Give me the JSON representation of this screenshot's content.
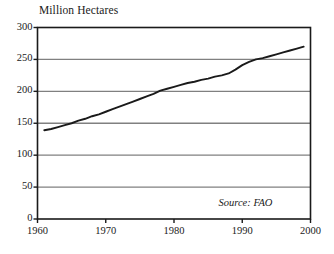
{
  "chart_data": {
    "type": "line",
    "title": "Million Hectares",
    "xlabel": "",
    "ylabel": "",
    "xlim": [
      1960,
      2000
    ],
    "ylim": [
      0,
      300
    ],
    "grid": "horizontal",
    "legend": "none",
    "annotation": "Source: FAO",
    "x_ticks": [
      "1960",
      "1970",
      "1980",
      "1990",
      "2000"
    ],
    "y_ticks": [
      "0",
      "50",
      "100",
      "150",
      "200",
      "250",
      "300"
    ],
    "series": [
      {
        "name": "Irrigated area",
        "x": [
          1961,
          1962,
          1963,
          1964,
          1965,
          1966,
          1967,
          1968,
          1969,
          1970,
          1971,
          1972,
          1973,
          1974,
          1975,
          1976,
          1977,
          1978,
          1979,
          1980,
          1981,
          1982,
          1983,
          1984,
          1985,
          1986,
          1987,
          1988,
          1989,
          1990,
          1991,
          1992,
          1993,
          1994,
          1995,
          1996,
          1997,
          1998,
          1999
        ],
        "values": [
          139,
          141,
          144,
          147,
          150,
          154,
          157,
          161,
          164,
          168,
          172,
          176,
          180,
          184,
          188,
          192,
          196,
          201,
          204,
          207,
          210,
          213,
          215,
          218,
          220,
          223,
          225,
          228,
          234,
          241,
          246,
          250,
          252,
          255,
          258,
          261,
          264,
          267,
          270
        ]
      }
    ]
  },
  "chart": {
    "title": "Million Hectares",
    "source": "Source: FAO",
    "y_axis": {
      "ticks": [
        {
          "label": "300",
          "value": 300
        },
        {
          "label": "250",
          "value": 250
        },
        {
          "label": "200",
          "value": 200
        },
        {
          "label": "150",
          "value": 150
        },
        {
          "label": "100",
          "value": 100
        },
        {
          "label": "50",
          "value": 50
        },
        {
          "label": "0",
          "value": 0
        }
      ]
    },
    "x_axis": {
      "ticks": [
        {
          "label": "1960",
          "value": 1960
        },
        {
          "label": "1970",
          "value": 1970
        },
        {
          "label": "1980",
          "value": 1980
        },
        {
          "label": "1990",
          "value": 1990
        },
        {
          "label": "2000",
          "value": 2000
        }
      ]
    },
    "colors": {
      "background": "#ffffff",
      "frame": "#1a1a1a",
      "gridline": "#808080",
      "data_line": "#1a1a1a",
      "text": "#1a1a1a"
    }
  }
}
